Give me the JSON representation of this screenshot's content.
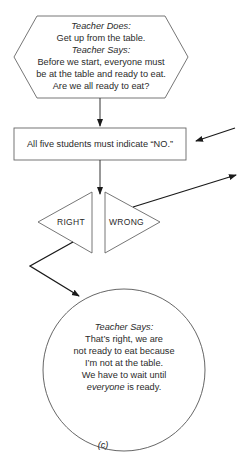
{
  "figure_label": "(c)",
  "hexagon": {
    "heading1": "Teacher Does:",
    "line1": "Get up from the table.",
    "heading2": "Teacher Says:",
    "line2": "Before we start, everyone must",
    "line3": "be at the table and ready to eat.",
    "line4": "Are we all ready to eat?"
  },
  "rectangle": {
    "text": "All five students must indicate “NO.”"
  },
  "decision": {
    "right_label": "RIGHT",
    "wrong_label": "WRONG"
  },
  "circle": {
    "heading": "Teacher Says:",
    "line1": "That’s right, we are",
    "line2": "not ready to eat because",
    "line3": "I’m not at the table.",
    "line4": "We have to wait until",
    "line5_em": "everyone",
    "line5_rest": " is ready."
  },
  "colors": {
    "stroke": "#555555",
    "arrow": "#1a1a1a",
    "background": "#ffffff"
  }
}
